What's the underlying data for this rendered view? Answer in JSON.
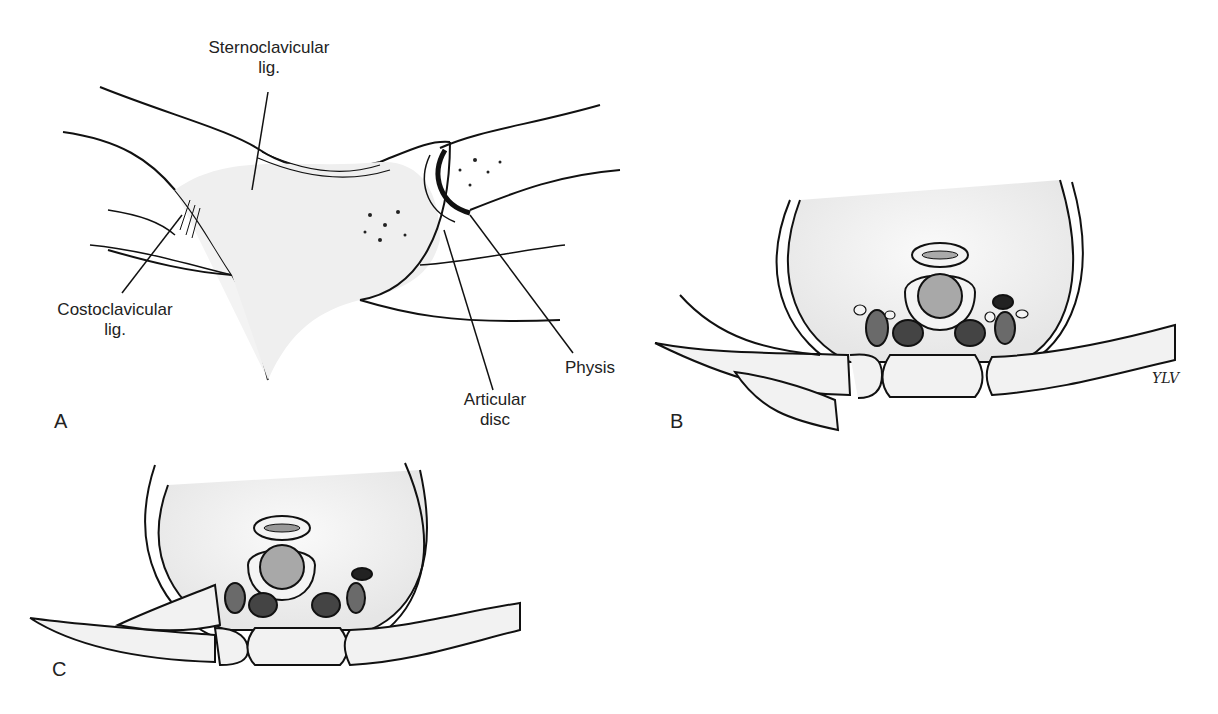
{
  "figure": {
    "panels": [
      {
        "id": "A",
        "label": "A"
      },
      {
        "id": "B",
        "label": "B"
      },
      {
        "id": "C",
        "label": "C"
      }
    ],
    "annotations": {
      "sternoclavicular": {
        "line1": "Sternoclavicular",
        "line2": "lig."
      },
      "costoclavicular": {
        "line1": "Costoclavicular",
        "line2": "lig."
      },
      "articular_disc": {
        "line1": "Articular",
        "line2": "disc"
      },
      "physis": {
        "line1": "Physis"
      }
    },
    "signature": "YLV",
    "colors": {
      "bone_fill": "#f2f2f2",
      "outline": "#111111",
      "trachea_fill": "#a8a8a8",
      "vessel_dark": "#444444",
      "vessel_mid": "#6a6a6a",
      "esophagus_fill": "#8e8e8e"
    }
  }
}
